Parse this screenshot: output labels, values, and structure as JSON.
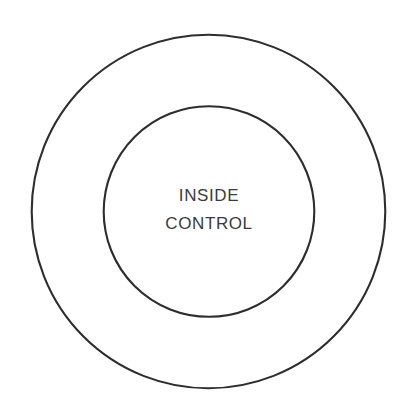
{
  "canvas": {
    "width": 418,
    "height": 416,
    "background_color": "#ffffff"
  },
  "diagram": {
    "type": "concentric-circles",
    "title": "",
    "stroke_color": "#2d2d2d",
    "stroke_width": 2.1,
    "text_color": "#3b3b3b",
    "shapes": [
      {
        "name": "outer-circle",
        "label": "",
        "center_x": 208.5,
        "center_y": 211.5,
        "radius": 177.5,
        "fill": "none"
      },
      {
        "name": "inner-circle",
        "label": "INSIDE CONTROL",
        "center_x": 209,
        "center_y": 211.5,
        "radius": 106,
        "fill": "none"
      }
    ],
    "inner_label": {
      "line1": "INSIDE",
      "line2": "CONTROL"
    }
  }
}
